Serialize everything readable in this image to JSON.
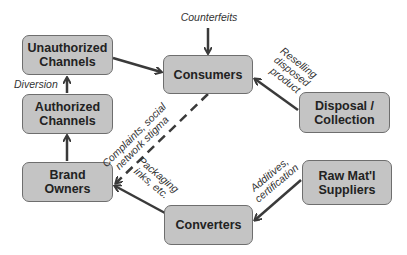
{
  "nodes": {
    "unauthorized_channels": "Unauthorized\nChannels",
    "consumers": "Consumers",
    "authorized_channels": "Authorized\nChannels",
    "disposal_collection": "Disposal /\nCollection",
    "brand_owners": "Brand\nOwners",
    "raw_suppliers": "Raw Mat'l\nSuppliers",
    "converters": "Converters"
  },
  "edge_labels": {
    "counterfeits": "Counterfeits",
    "diversion": "Diversion",
    "reselling": "Reselling\ndisposed\nproduct",
    "complaints": "Complaints, social\nnetwork stigma",
    "packaging": "Packaging\ninks, etc.",
    "additives": "Additives,\ncertification"
  },
  "colors": {
    "node_fill": "#c4c4c4",
    "node_border": "#6e6e6e",
    "arrow": "#3a3a3a"
  }
}
